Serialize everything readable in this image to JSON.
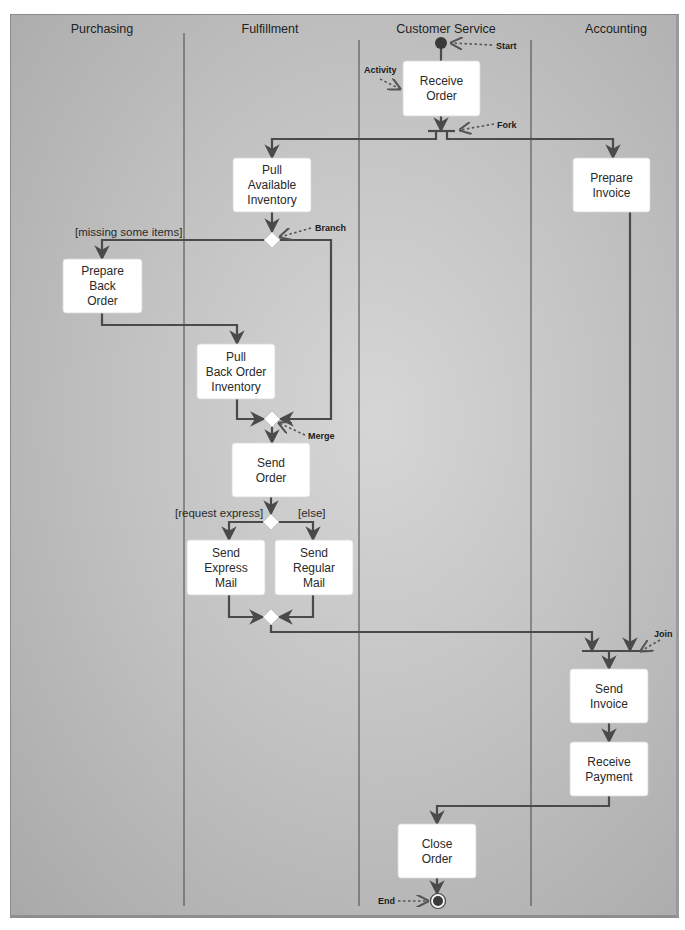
{
  "lanes": [
    {
      "id": "purchasing",
      "label": "Purchasing",
      "title_x": 102
    },
    {
      "id": "fulfillment",
      "label": "Fulfillment",
      "title_x": 270
    },
    {
      "id": "customer-service",
      "label": "Customer Service",
      "title_x": 446
    },
    {
      "id": "accounting",
      "label": "Accounting",
      "title_x": 616
    }
  ],
  "lane_dividers": [
    {
      "x": 184,
      "y1": 33,
      "y2": 906
    },
    {
      "x": 359,
      "y1": 40,
      "y2": 906
    },
    {
      "x": 531,
      "y1": 40,
      "y2": 906
    }
  ],
  "activities": [
    {
      "id": "receive-order",
      "lines": [
        "Receive",
        "Order"
      ],
      "x": 403,
      "y": 61,
      "w": 77,
      "h": 55
    },
    {
      "id": "pull-available-inventory",
      "lines": [
        "Pull",
        "Available",
        "Inventory"
      ],
      "x": 233,
      "y": 158,
      "w": 78,
      "h": 54
    },
    {
      "id": "prepare-invoice",
      "lines": [
        "Prepare",
        "Invoice"
      ],
      "x": 573,
      "y": 158,
      "w": 77,
      "h": 54
    },
    {
      "id": "prepare-back-order",
      "lines": [
        "Prepare",
        "Back",
        "Order"
      ],
      "x": 63,
      "y": 259,
      "w": 79,
      "h": 54
    },
    {
      "id": "pull-back-order-inventory",
      "lines": [
        "Pull",
        "Back Order",
        "Inventory"
      ],
      "x": 197,
      "y": 344,
      "w": 78,
      "h": 55
    },
    {
      "id": "send-order",
      "lines": [
        "Send",
        "Order"
      ],
      "x": 232,
      "y": 443,
      "w": 78,
      "h": 54
    },
    {
      "id": "send-express-mail",
      "lines": [
        "Send",
        "Express",
        "Mail"
      ],
      "x": 187,
      "y": 540,
      "w": 78,
      "h": 55
    },
    {
      "id": "send-regular-mail",
      "lines": [
        "Send",
        "Regular",
        "Mail"
      ],
      "x": 275,
      "y": 540,
      "w": 78,
      "h": 55
    },
    {
      "id": "send-invoice",
      "lines": [
        "Send",
        "Invoice"
      ],
      "x": 570,
      "y": 669,
      "w": 78,
      "h": 54
    },
    {
      "id": "receive-payment",
      "lines": [
        "Receive",
        "Payment"
      ],
      "x": 570,
      "y": 742,
      "w": 78,
      "h": 54
    },
    {
      "id": "close-order",
      "lines": [
        "Close",
        "Order"
      ],
      "x": 398,
      "y": 824,
      "w": 78,
      "h": 54
    }
  ],
  "diamonds": [
    {
      "id": "branch-diamond",
      "cx": 272,
      "cy": 240
    },
    {
      "id": "merge-diamond",
      "cx": 272,
      "cy": 419
    },
    {
      "id": "express-decision-diamond",
      "cx": 271,
      "cy": 522
    },
    {
      "id": "mail-merge-diamond",
      "cx": 271,
      "cy": 617
    }
  ],
  "start_node": {
    "cx": 441,
    "cy": 43
  },
  "end_node": {
    "cx": 438,
    "cy": 901
  },
  "fork_bar": {
    "x1": 428,
    "x2": 455,
    "y": 131
  },
  "join_bar": {
    "x1": 582,
    "x2": 648,
    "y": 651
  },
  "flows": [
    {
      "id": "start-to-receive",
      "points": [
        [
          441,
          43
        ],
        [
          441,
          61
        ]
      ],
      "arrow": false
    },
    {
      "id": "receive-to-fork",
      "points": [
        [
          441,
          116
        ],
        [
          441,
          131
        ]
      ],
      "arrow": true
    },
    {
      "id": "fork-left-to-pull",
      "points": [
        [
          436,
          131
        ],
        [
          436,
          139
        ],
        [
          272,
          139
        ],
        [
          272,
          158
        ]
      ],
      "arrow": true
    },
    {
      "id": "fork-right-to-invoice",
      "points": [
        [
          447,
          131
        ],
        [
          447,
          139
        ],
        [
          613,
          139
        ],
        [
          613,
          158
        ]
      ],
      "arrow": true
    },
    {
      "id": "pull-to-branch",
      "points": [
        [
          272,
          212
        ],
        [
          272,
          232
        ]
      ],
      "arrow": true
    },
    {
      "id": "branch-to-backorder",
      "points": [
        [
          264,
          240
        ],
        [
          102,
          240
        ],
        [
          102,
          259
        ]
      ],
      "arrow": true
    },
    {
      "id": "branch-to-merge",
      "points": [
        [
          280,
          240
        ],
        [
          331,
          240
        ],
        [
          331,
          419
        ],
        [
          280,
          419
        ]
      ],
      "arrow": true
    },
    {
      "id": "backorder-to-pull-bo",
      "points": [
        [
          102,
          313
        ],
        [
          102,
          325
        ],
        [
          237,
          325
        ],
        [
          237,
          344
        ]
      ],
      "arrow": true
    },
    {
      "id": "pull-bo-to-merge",
      "points": [
        [
          237,
          399
        ],
        [
          237,
          419
        ],
        [
          264,
          419
        ]
      ],
      "arrow": true
    },
    {
      "id": "merge-to-send-order",
      "points": [
        [
          272,
          427
        ],
        [
          272,
          443
        ]
      ],
      "arrow": true
    },
    {
      "id": "send-order-to-decision",
      "points": [
        [
          271,
          497
        ],
        [
          271,
          514
        ]
      ],
      "arrow": true
    },
    {
      "id": "decision-to-express",
      "points": [
        [
          263,
          522
        ],
        [
          229,
          522
        ],
        [
          229,
          540
        ]
      ],
      "arrow": true
    },
    {
      "id": "decision-to-regular",
      "points": [
        [
          279,
          522
        ],
        [
          313,
          522
        ],
        [
          313,
          540
        ]
      ],
      "arrow": true
    },
    {
      "id": "express-to-mail-merge",
      "points": [
        [
          229,
          595
        ],
        [
          229,
          617
        ],
        [
          263,
          617
        ]
      ],
      "arrow": true
    },
    {
      "id": "regular-to-mail-merge",
      "points": [
        [
          313,
          595
        ],
        [
          313,
          617
        ],
        [
          279,
          617
        ]
      ],
      "arrow": true
    },
    {
      "id": "mail-merge-to-join",
      "points": [
        [
          271,
          625
        ],
        [
          271,
          632
        ],
        [
          592,
          632
        ],
        [
          592,
          651
        ]
      ],
      "arrow": true
    },
    {
      "id": "invoice-to-join",
      "points": [
        [
          630,
          212
        ],
        [
          630,
          651
        ]
      ],
      "arrow": true
    },
    {
      "id": "join-to-send-invoice",
      "points": [
        [
          609,
          651
        ],
        [
          609,
          669
        ]
      ],
      "arrow": true
    },
    {
      "id": "send-invoice-to-receive-payment",
      "points": [
        [
          609,
          723
        ],
        [
          609,
          742
        ]
      ],
      "arrow": true
    },
    {
      "id": "payment-to-close-order",
      "points": [
        [
          609,
          796
        ],
        [
          609,
          806
        ],
        [
          437,
          806
        ],
        [
          437,
          824
        ]
      ],
      "arrow": true
    },
    {
      "id": "close-order-to-end",
      "points": [
        [
          437,
          878
        ],
        [
          437,
          894
        ]
      ],
      "arrow": true
    }
  ],
  "guards": [
    {
      "id": "guard-missing-items",
      "text": "[missing some items]",
      "x": 75,
      "y": 236
    },
    {
      "id": "guard-request-express",
      "text": "[request express]",
      "x": 175,
      "y": 517
    },
    {
      "id": "guard-else",
      "text": "[else]",
      "x": 298,
      "y": 517
    }
  ],
  "callouts": [
    {
      "id": "callout-start",
      "text": "Start",
      "tx": 496,
      "ty": 49,
      "from": [
        492,
        45
      ],
      "to": [
        451,
        43
      ]
    },
    {
      "id": "callout-activity",
      "text": "Activity",
      "tx": 364,
      "ty": 73,
      "from": [
        380,
        79
      ],
      "to": [
        400,
        89
      ]
    },
    {
      "id": "callout-fork",
      "text": "Fork",
      "tx": 497,
      "ty": 128,
      "from": [
        494,
        124
      ],
      "to": [
        460,
        130
      ]
    },
    {
      "id": "callout-branch",
      "text": "Branch",
      "tx": 315,
      "ty": 231,
      "from": [
        311,
        228
      ],
      "to": [
        280,
        237
      ]
    },
    {
      "id": "callout-merge",
      "text": "Merge",
      "tx": 308,
      "ty": 439,
      "from": [
        305,
        435
      ],
      "to": [
        279,
        423
      ]
    },
    {
      "id": "callout-join",
      "text": "Join",
      "tx": 654,
      "ty": 637,
      "from": [
        660,
        640
      ],
      "to": [
        641,
        651
      ]
    },
    {
      "id": "callout-end",
      "text": "End",
      "tx": 378,
      "ty": 904,
      "from": [
        398,
        901
      ],
      "to": [
        428,
        901
      ]
    }
  ],
  "colors": {
    "line": "#4a4a4a",
    "node_fill": "#ffffff",
    "start_fill": "#3a3a3a",
    "callout_line": "#555555"
  }
}
